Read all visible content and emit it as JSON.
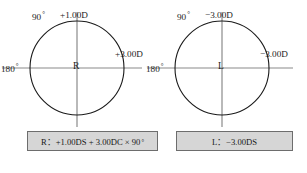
{
  "figure": {
    "caption": "",
    "line_color": "#8a8a8a",
    "circle_color": "#1a1a1a",
    "box_fill": "#d6d6d6",
    "box_border": "#6d6d6d"
  },
  "eyes": [
    {
      "id": "right-eye",
      "center_mark": "R",
      "axis_vertical_label": "90",
      "axis_vertical_degree": "°",
      "power_vertical": "+1.00D",
      "axis_horizontal_label": "180",
      "axis_horizontal_degree": "°",
      "power_horizontal": "+3.00D",
      "prescription": "R：+1.00DS + 3.00DC × 90",
      "prescription_degree": "°"
    },
    {
      "id": "left-eye",
      "center_mark": "L",
      "axis_vertical_label": "90",
      "axis_vertical_degree": "°",
      "power_vertical": "−3.00D",
      "axis_horizontal_label": "180",
      "axis_horizontal_degree": "°",
      "power_horizontal": "−3.00D",
      "prescription": "L：−3.00DS",
      "prescription_degree": ""
    }
  ]
}
